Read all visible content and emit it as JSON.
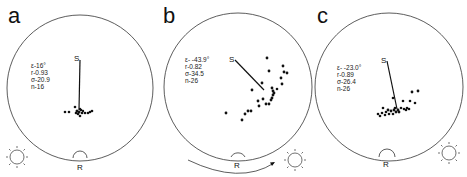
{
  "figure": {
    "panels": [
      {
        "label": "a",
        "stats": {
          "epsilon": "ε-16°",
          "r": "r-0.93",
          "sigma": "σ-20.9",
          "n": "n-16"
        },
        "s_label": "S",
        "r_label": "R",
        "sun_position": "bottom-left",
        "rotation_arrow": false
      },
      {
        "label": "b",
        "stats": {
          "epsilon": "ε- -43.9°",
          "r": "r-0.82",
          "sigma": "σ-34.5",
          "n": "n-26"
        },
        "s_label": "S",
        "r_label": "R",
        "sun_position": "bottom-right",
        "rotation_arrow": true
      },
      {
        "label": "c",
        "stats": {
          "epsilon": "ε- -23.0°",
          "r": "r-0.89",
          "sigma": "σ-26.4",
          "n": "n-26"
        },
        "s_label": "S",
        "r_label": "R",
        "sun_position": "bottom-right",
        "rotation_arrow": false
      }
    ],
    "colors": {
      "ink": "#111111",
      "background": "#ffffff"
    }
  }
}
